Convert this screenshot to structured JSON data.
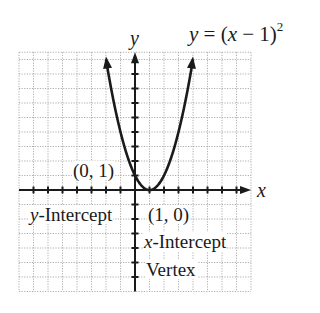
{
  "chart_data": {
    "type": "line",
    "equation": {
      "lhs": "y",
      "rhs_base": "(x − 1)",
      "exponent": "2"
    },
    "xlabel": "x",
    "ylabel": "y",
    "xlim": [
      -8,
      8
    ],
    "ylim": [
      -7,
      9.5
    ],
    "grid": true,
    "grid_style": "dotted",
    "series": [
      {
        "name": "y = (x − 1)^2",
        "function": "(x-1)^2",
        "x": [
          -2,
          -1.5,
          -1,
          -0.5,
          0,
          0.5,
          1,
          1.5,
          2,
          2.5,
          3,
          3.5,
          4
        ],
        "y": [
          9,
          6.25,
          4,
          2.25,
          1,
          0.25,
          0,
          0.25,
          1,
          2.25,
          4,
          6.25,
          9
        ],
        "arrows_at_ends": true
      }
    ],
    "annotations": [
      {
        "text": "(0, 1)",
        "x": 0,
        "y": 1,
        "role": "y-intercept point"
      },
      {
        "text": "y-Intercept",
        "role": "label for (0, 1)"
      },
      {
        "text": "(1, 0)",
        "x": 1,
        "y": 0,
        "role": "x-intercept and vertex point"
      },
      {
        "text": "x-Intercept",
        "role": "label for (1, 0)"
      },
      {
        "text": "Vertex",
        "role": "label for (1, 0)"
      }
    ]
  },
  "labels": {
    "title_y": "y",
    "title_eq": " = (",
    "title_x": "x",
    "title_rest": " − 1)",
    "title_exp": "2",
    "axis_x": "x",
    "axis_y": "y",
    "point_y_intercept": "(0, 1)",
    "y_intercept_var": "y",
    "y_intercept_word": "-Intercept",
    "point_vertex": "(1, 0)",
    "x_intercept_var": "x",
    "x_intercept_word": "-Intercept",
    "vertex_word": "Vertex"
  },
  "colors": {
    "ink": "#1a1a1a",
    "grid": "#9a9a9a",
    "background": "#ffffff"
  }
}
